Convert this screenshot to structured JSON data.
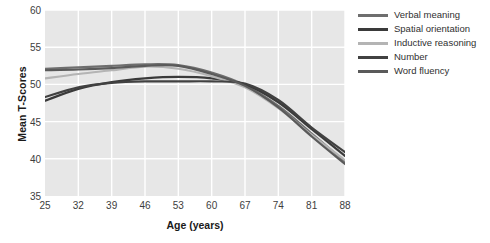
{
  "chart_data": {
    "type": "line",
    "title": "",
    "xlabel": "Age (years)",
    "ylabel": "Mean T-Scores",
    "x": [
      25,
      32,
      39,
      46,
      53,
      60,
      67,
      74,
      81,
      88
    ],
    "xlim": [
      25,
      88
    ],
    "ylim": [
      35,
      60
    ],
    "xticks": [
      "25",
      "32",
      "39",
      "46",
      "53",
      "60",
      "67",
      "74",
      "81",
      "88"
    ],
    "yticks": [
      "35",
      "40",
      "45",
      "50",
      "55",
      "60"
    ],
    "grid": true,
    "legend_position": "right",
    "series": [
      {
        "name": "Verbal meaning",
        "color": "#6e6e6e",
        "values": [
          52.1,
          52.3,
          52.5,
          52.7,
          52.6,
          51.6,
          49.9,
          47.1,
          43.4,
          39.6
        ]
      },
      {
        "name": "Spatial orientation",
        "color": "#3a3a3a",
        "values": [
          47.8,
          49.4,
          50.3,
          50.8,
          51.0,
          50.8,
          50.0,
          47.6,
          44.0,
          40.4
        ]
      },
      {
        "name": "Inductive reasoning",
        "color": "#b4b4b4",
        "values": [
          50.8,
          51.4,
          51.9,
          52.4,
          52.1,
          51.1,
          49.6,
          46.8,
          43.2,
          39.8
        ]
      },
      {
        "name": "Number",
        "color": "#414141",
        "values": [
          48.3,
          49.6,
          50.2,
          50.4,
          50.4,
          50.4,
          50.1,
          47.9,
          44.2,
          40.9
        ]
      },
      {
        "name": "Word fluency",
        "color": "#5a5a5a",
        "values": [
          51.9,
          52.0,
          52.2,
          52.5,
          52.5,
          51.4,
          49.8,
          46.9,
          43.0,
          39.3
        ]
      }
    ]
  },
  "style": {
    "panel_bg": "#e7e7e7",
    "grid_color": "#ffffff",
    "tick_color": "#3d3d3d",
    "axis_title_color": "#1a1a1a"
  }
}
